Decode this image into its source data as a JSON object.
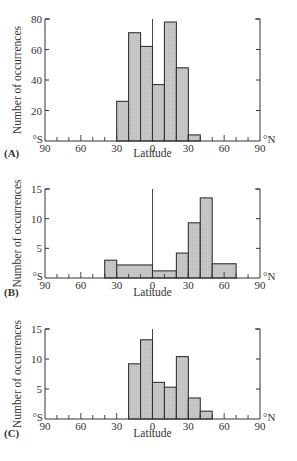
{
  "figure": {
    "fill_color": "#c9c9c9",
    "line_color": "#333333",
    "x_label": "Latitude",
    "y_label": "Number of occurrences",
    "south_marker": "°S",
    "north_marker": "°N",
    "x_ticks": [
      "90",
      "60",
      "30",
      "0",
      "30",
      "60",
      "90"
    ]
  },
  "chart_data": [
    {
      "type": "bar",
      "panel": "(A)",
      "title": "",
      "xlabel": "Latitude",
      "ylabel": "Number of occurrences",
      "xlim": [
        -90,
        90
      ],
      "ylim": [
        0,
        80
      ],
      "y_ticks": [
        "20",
        "40",
        "60",
        "80"
      ],
      "y_tick_values": [
        20,
        40,
        60,
        80
      ],
      "y_zero_label": "°S",
      "bins": [
        {
          "from": -30,
          "to": -20,
          "value": 26
        },
        {
          "from": -20,
          "to": -10,
          "value": 71
        },
        {
          "from": -10,
          "to": 0,
          "value": 62
        },
        {
          "from": 0,
          "to": 10,
          "value": 37
        },
        {
          "from": 10,
          "to": 20,
          "value": 78
        },
        {
          "from": 20,
          "to": 30,
          "value": 48
        },
        {
          "from": 30,
          "to": 40,
          "value": 4
        }
      ]
    },
    {
      "type": "bar",
      "panel": "(B)",
      "title": "",
      "xlabel": "Latitude",
      "ylabel": "Number of occurrences",
      "xlim": [
        -90,
        90
      ],
      "ylim": [
        0,
        15
      ],
      "y_ticks": [
        "5",
        "10",
        "15"
      ],
      "y_tick_values": [
        5,
        10,
        15
      ],
      "y_zero_label": "°S",
      "bins": [
        {
          "from": -40,
          "to": -30,
          "value": 3
        },
        {
          "from": -30,
          "to": 0,
          "value": 2.2
        },
        {
          "from": 0,
          "to": 20,
          "value": 1.2
        },
        {
          "from": 20,
          "to": 30,
          "value": 4.2
        },
        {
          "from": 30,
          "to": 40,
          "value": 9.3
        },
        {
          "from": 40,
          "to": 50,
          "value": 13.5
        },
        {
          "from": 50,
          "to": 70,
          "value": 2.4
        }
      ]
    },
    {
      "type": "bar",
      "panel": "(C)",
      "title": "",
      "xlabel": "Latitude",
      "ylabel": "Number of occurrences",
      "xlim": [
        -90,
        90
      ],
      "ylim": [
        0,
        15
      ],
      "y_ticks": [
        "5",
        "10",
        "15"
      ],
      "y_tick_values": [
        5,
        10,
        15
      ],
      "y_zero_label": "°S",
      "bins": [
        {
          "from": -20,
          "to": -10,
          "value": 9.2
        },
        {
          "from": -10,
          "to": 0,
          "value": 13.2
        },
        {
          "from": 0,
          "to": 10,
          "value": 6.1
        },
        {
          "from": 10,
          "to": 20,
          "value": 5.3
        },
        {
          "from": 20,
          "to": 30,
          "value": 10.4
        },
        {
          "from": 30,
          "to": 40,
          "value": 3.5
        },
        {
          "from": 40,
          "to": 50,
          "value": 1.3
        }
      ]
    }
  ]
}
